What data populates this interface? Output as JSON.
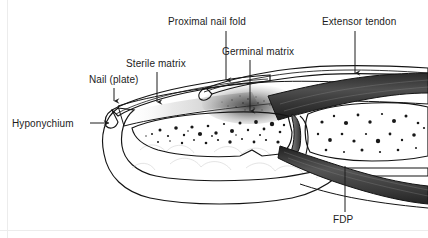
{
  "figure": {
    "width": 428,
    "height": 238,
    "background_color": "#ffffff",
    "border_color": "#e8e8e8",
    "ink_color": "#141414",
    "label_color": "#1c1c1c",
    "tendon_fill": "#4a4a4a",
    "bone_fill": "#fbfbfb",
    "soft_tissue_fill": "#fcfcfc",
    "cartilage_fill": "#6b6b6b"
  },
  "labels": [
    {
      "id": "proximal-nail-fold",
      "text": "Proximal nail fold",
      "text_x": 168,
      "text_y": 25,
      "leader": "M 226 31 L 226 79",
      "arrow_x": 226,
      "arrow_y": 83,
      "anchor": "start"
    },
    {
      "id": "extensor-tendon",
      "text": "Extensor tendon",
      "text_x": 322,
      "text_y": 25,
      "leader": "M 355 31 L 355 72",
      "arrow_x": 355,
      "arrow_y": 76,
      "anchor": "start"
    },
    {
      "id": "germinal-matrix",
      "text": "Germinal matrix",
      "text_x": 222,
      "text_y": 55,
      "leader": "M 250 60 L 250 110",
      "arrow_x": 250,
      "arrow_y": 114,
      "anchor": "start"
    },
    {
      "id": "sterile-matrix",
      "text": "Sterile matrix",
      "text_x": 126,
      "text_y": 67,
      "leader": "M 157 72 L 157 101",
      "arrow_x": 157,
      "arrow_y": 105,
      "anchor": "start"
    },
    {
      "id": "nail-plate",
      "text": "Nail (plate)",
      "text_x": 89,
      "text_y": 83,
      "leader": "M 114 88 L 114 100",
      "arrow_x": 114,
      "arrow_y": 104,
      "anchor": "start"
    },
    {
      "id": "hyponychium",
      "text": "Hyponychium",
      "text_x": 12,
      "text_y": 127,
      "leader": "M 90 123 L 108 123",
      "arrow_x": 113,
      "arrow_y": 123,
      "arrow_dir": "right",
      "anchor": "start"
    },
    {
      "id": "fdp",
      "text": "FDP",
      "text_x": 333,
      "text_y": 223,
      "leader": "M 345 212 L 345 166",
      "anchor": "start"
    }
  ],
  "structures": [
    {
      "id": "nail-plate-body",
      "name": "nail plate"
    },
    {
      "id": "distal-phalanx",
      "name": "distal phalanx"
    },
    {
      "id": "middle-phalanx",
      "name": "middle phalanx"
    },
    {
      "id": "dip-joint",
      "name": "distal interphalangeal joint"
    },
    {
      "id": "extensor-tendon-body",
      "name": "extensor tendon"
    },
    {
      "id": "fdp-tendon-body",
      "name": "flexor digitorum profundus tendon"
    },
    {
      "id": "pulp-fat-pad",
      "name": "pulp fat pad"
    },
    {
      "id": "germinal-matrix-zone",
      "name": "germinal matrix"
    },
    {
      "id": "sterile-matrix-zone",
      "name": "sterile matrix"
    }
  ]
}
